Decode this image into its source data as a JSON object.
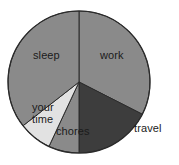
{
  "chart_data": {
    "type": "pie",
    "title": "",
    "subtitle": "",
    "xlabel": "",
    "ylabel": "",
    "grid": false,
    "legend_position": "none",
    "labels_position": "inside-and-outside",
    "categories": [
      "work",
      "travel",
      "chores",
      "your time",
      "sleep"
    ],
    "values": [
      32.5,
      17.5,
      7,
      7.5,
      35.5
    ],
    "units": "percent",
    "slices": [
      {
        "label": "work",
        "value": 32.5,
        "start_angle": 0,
        "end_angle": 117,
        "color": "#8a8a8a",
        "label_placement": "inside"
      },
      {
        "label": "travel",
        "value": 17.5,
        "start_angle": 117,
        "end_angle": 180,
        "color": "#3d3d3d",
        "label_placement": "outside"
      },
      {
        "label": "chores",
        "value": 7,
        "start_angle": 180,
        "end_angle": 205,
        "color": "#8a8a8a",
        "label_placement": "inside"
      },
      {
        "label": "your time",
        "value": 7.5,
        "start_angle": 205,
        "end_angle": 232,
        "color": "#e2e2e2",
        "label_placement": "inside"
      },
      {
        "label": "sleep",
        "value": 35.5,
        "start_angle": 232,
        "end_angle": 360,
        "color": "#8a8a8a",
        "label_placement": "inside"
      }
    ],
    "colors": {
      "background": "#ffffff",
      "slice_gray": "#8a8a8a",
      "slice_dark": "#3d3d3d",
      "slice_light": "#e2e2e2",
      "outline": "#2b2b2b",
      "label_text": "#1b1b1b"
    },
    "geometry": {
      "center_x": 79,
      "center_y": 82,
      "radius": 71
    }
  },
  "labels": {
    "sleep": "sleep",
    "work": "work",
    "travel": "travel",
    "your_time_line1": "your",
    "your_time_line2": "time",
    "chores": "chores"
  }
}
